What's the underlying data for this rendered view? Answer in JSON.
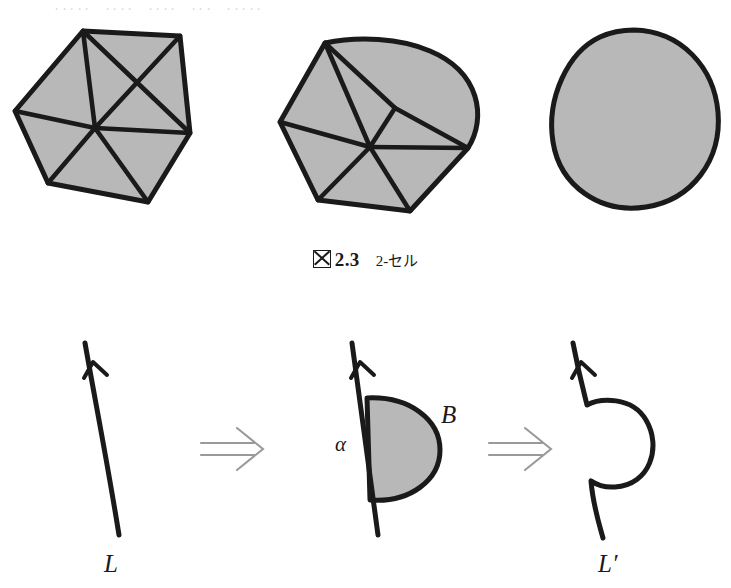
{
  "page": {
    "header_partial_text": "．．．．．　．．．．　．．．．　．．．　．．．．．",
    "background_color": "#ffffff",
    "ink_color": "#1a1a1a",
    "fill_gray": "#b8b8b8",
    "arrow_gray": "#9a9a9a"
  },
  "caption": {
    "boxed_glyph": "図",
    "figure_number": "2.3",
    "title": "2-セル",
    "full_text": "図 2.3  2-セル"
  },
  "top_row": {
    "panels": [
      {
        "id": "triangulated-hexagon",
        "name": "triangulated-polygon",
        "description": "2-cell triangulated as a hexagon with six triangles meeting at an interior vertex",
        "shape": "polygon",
        "edges": "straight",
        "vertex_count": 6,
        "triangle_count": 6,
        "filled": true
      },
      {
        "id": "triangulated-curved-polygon",
        "name": "triangulated-curved-polygon",
        "description": "2-cell with one curved boundary arc, triangulated from an interior vertex",
        "shape": "polygon-with-arc",
        "edges": "mixed",
        "vertex_count": 6,
        "triangle_count": 6,
        "filled": true
      },
      {
        "id": "smooth-disk",
        "name": "smooth-2-cell-disk",
        "description": "2-cell as a smooth topological disk with no triangulation",
        "shape": "blob",
        "edges": "curved",
        "vertex_count": 0,
        "triangle_count": 0,
        "filled": true
      }
    ]
  },
  "bottom_row": {
    "panels": [
      {
        "id": "line-L",
        "name": "oriented-line-L",
        "label": "L",
        "description": "An oriented line L with an upward arrowhead"
      },
      {
        "id": "line-with-disk",
        "name": "line-with-attached-disk",
        "labels": {
          "left": "α",
          "right": "B"
        },
        "description": "The line with a shaded half-disk B attached on the right side along the arc α"
      },
      {
        "id": "line-Lprime",
        "name": "deformed-line-L-prime",
        "label": "L′",
        "description": "The resulting deformed line L′ pushed around the former disk"
      }
    ],
    "transform_arrows": [
      {
        "glyph": "⟹",
        "name": "implies-arrow-1"
      },
      {
        "glyph": "⟹",
        "name": "implies-arrow-2"
      }
    ]
  }
}
